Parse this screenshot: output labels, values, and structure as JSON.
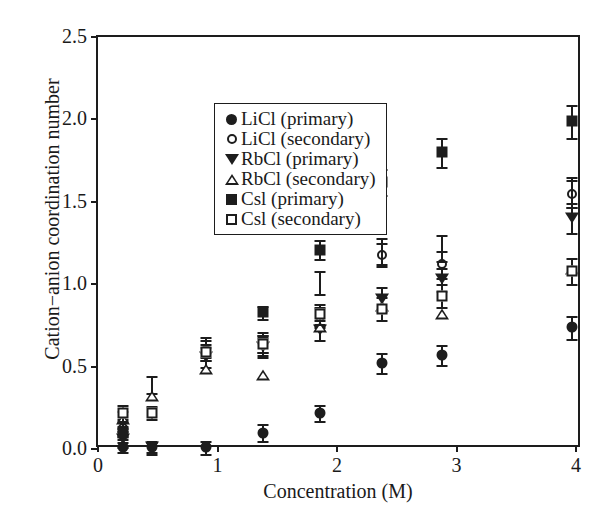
{
  "chart_data": {
    "type": "scatter",
    "title": "",
    "xlabel": "Concentration (M)",
    "ylabel": "Cation−anion coordination number",
    "xlim": [
      0,
      4.05
    ],
    "ylim": [
      0.0,
      2.5
    ],
    "xticks": [
      "0",
      "1",
      "2",
      "3",
      "4"
    ],
    "xtick_values": [
      0,
      1,
      2,
      3,
      4
    ],
    "yticks": [
      "0.0",
      "0.5",
      "1.0",
      "1.5",
      "2.0",
      "2.5"
    ],
    "ytick_values": [
      0.0,
      0.5,
      1.0,
      1.5,
      2.0,
      2.5
    ],
    "grid": false,
    "legend_position": "upper left",
    "error_bars": true,
    "series": [
      {
        "name": "LiCl (primary)",
        "marker": "filled-circle",
        "color": "#1d1d1d",
        "points": [
          {
            "x": 0.21,
            "y": 0.01,
            "yerr": 0.03
          },
          {
            "x": 0.45,
            "y": 0.01,
            "yerr": 0.03
          },
          {
            "x": 0.9,
            "y": 0.01,
            "yerr": 0.04
          },
          {
            "x": 1.38,
            "y": 0.1,
            "yerr": 0.05
          },
          {
            "x": 1.86,
            "y": 0.22,
            "yerr": 0.05
          },
          {
            "x": 2.38,
            "y": 0.52,
            "yerr": 0.06
          },
          {
            "x": 2.88,
            "y": 0.57,
            "yerr": 0.06
          },
          {
            "x": 3.97,
            "y": 0.74,
            "yerr": 0.07
          }
        ]
      },
      {
        "name": "LiCl (secondary)",
        "marker": "open-circle",
        "color": "#1d1d1d",
        "points": [
          {
            "x": 0.21,
            "y": 0.13,
            "yerr": 0.05
          },
          {
            "x": 0.9,
            "y": 0.6,
            "yerr": 0.06
          },
          {
            "x": 1.38,
            "y": 0.63,
            "yerr": 0.06
          },
          {
            "x": 1.86,
            "y": 0.8,
            "yerr": 0.06
          },
          {
            "x": 2.38,
            "y": 1.18,
            "yerr": 0.07
          },
          {
            "x": 2.88,
            "y": 1.12,
            "yerr": 0.08
          },
          {
            "x": 3.97,
            "y": 1.55,
            "yerr": 0.08
          }
        ]
      },
      {
        "name": "RbCl (primary)",
        "marker": "filled-triangle-down",
        "color": "#1d1d1d",
        "points": [
          {
            "x": 0.21,
            "y": 0.06,
            "yerr": 0.05
          },
          {
            "x": 0.45,
            "y": 0.01,
            "yerr": 0.04
          },
          {
            "x": 0.9,
            "y": 0.56,
            "yerr": 0.06
          },
          {
            "x": 1.38,
            "y": 0.62,
            "yerr": 0.06
          },
          {
            "x": 1.86,
            "y": 0.72,
            "yerr": 0.06
          },
          {
            "x": 2.38,
            "y": 0.91,
            "yerr": 0.07
          },
          {
            "x": 2.88,
            "y": 1.03,
            "yerr": 0.07
          },
          {
            "x": 3.97,
            "y": 1.4,
            "yerr": 0.09
          }
        ]
      },
      {
        "name": "RbCl (secondary)",
        "marker": "open-triangle-up",
        "color": "#1d1d1d",
        "points": [
          {
            "x": 0.21,
            "y": 0.18,
            "yerr": 0.05
          },
          {
            "x": 0.45,
            "y": 0.39,
            "yerr": 0.05
          },
          {
            "x": 0.9,
            "y": 0.62,
            "yerr": 0.06
          },
          {
            "x": 1.38,
            "y": 0.65,
            "yerr": 0.06
          },
          {
            "x": 1.86,
            "y": 1.01,
            "yerr": 0.07
          },
          {
            "x": 2.38,
            "y": 1.2,
            "yerr": 0.08
          },
          {
            "x": 2.88,
            "y": 1.22,
            "yerr": 0.08
          },
          {
            "x": 3.97,
            "y": 1.56,
            "yerr": 0.09
          }
        ]
      },
      {
        "name": "CsI (primary)",
        "marker": "filled-square",
        "color": "#1d1d1d",
        "points": [
          {
            "x": 0.21,
            "y": 0.1,
            "yerr": 0.04
          },
          {
            "x": 1.38,
            "y": 0.83,
            "yerr": 0.04
          },
          {
            "x": 1.86,
            "y": 1.21,
            "yerr": 0.06
          },
          {
            "x": 2.38,
            "y": 1.62,
            "yerr": 0.08
          },
          {
            "x": 2.88,
            "y": 1.8,
            "yerr": 0.09
          },
          {
            "x": 3.97,
            "y": 1.99,
            "yerr": 0.1
          }
        ]
      },
      {
        "name": "CsI (secondary)",
        "marker": "open-square",
        "color": "#1d1d1d",
        "points": [
          {
            "x": 0.21,
            "y": 0.22,
            "yerr": 0.05
          },
          {
            "x": 0.45,
            "y": 0.22,
            "yerr": 0.04
          },
          {
            "x": 0.9,
            "y": 0.59,
            "yerr": 0.05
          },
          {
            "x": 1.38,
            "y": 0.64,
            "yerr": 0.05
          },
          {
            "x": 1.86,
            "y": 0.82,
            "yerr": 0.06
          },
          {
            "x": 2.38,
            "y": 0.85,
            "yerr": 0.07
          },
          {
            "x": 2.88,
            "y": 0.93,
            "yerr": 0.07
          },
          {
            "x": 3.97,
            "y": 1.08,
            "yerr": 0.08
          }
        ]
      }
    ],
    "legend": [
      {
        "label": "LiCl (primary)",
        "marker": "filled-circle"
      },
      {
        "label": "LiCl (secondary)",
        "marker": "open-circle"
      },
      {
        "label": "RbCl (primary)",
        "marker": "filled-triangle-down"
      },
      {
        "label": "RbCl (secondary)",
        "marker": "open-triangle-up"
      },
      {
        "label": "Csl (primary)",
        "marker": "filled-square"
      },
      {
        "label": "Csl (secondary)",
        "marker": "open-square"
      }
    ]
  }
}
